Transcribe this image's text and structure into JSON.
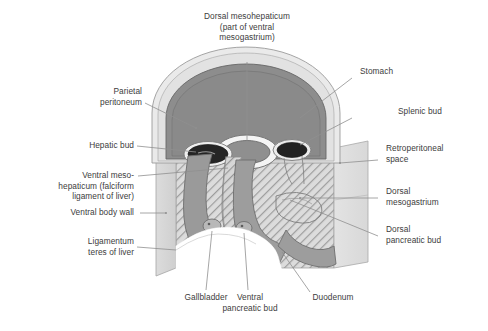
{
  "figure": {
    "colors": {
      "text": "#3c3c3c",
      "leader": "#8c8c8c",
      "stomach_fill": "#8d8d8d",
      "peritoneum_fill": "#e9e9e9",
      "bud_dark": "#2b2b2b",
      "mesogastrium_hatch": "#a9a9a9",
      "body_wall": "#d2d2d2",
      "outline": "#6f6f6f",
      "background": "#ffffff"
    }
  },
  "labels": {
    "top": [
      {
        "id": "dorsal-mesohepaticum",
        "text": "Dorsal mesohepaticum\n(part of ventral\nmesogastrium)",
        "align": "center"
      }
    ],
    "left": [
      {
        "id": "parietal-peritoneum",
        "text": "Parietal\nperitoneum"
      },
      {
        "id": "hepatic-bud",
        "text": "Hepatic bud"
      },
      {
        "id": "ventral-mesohepaticum",
        "text": "Ventral meso-\nhepaticum (falciform\nligament of liver)"
      },
      {
        "id": "ventral-body-wall",
        "text": "Ventral body wall"
      },
      {
        "id": "ligamentum-teres",
        "text": "Ligamentum\nteres of liver"
      }
    ],
    "right": [
      {
        "id": "stomach",
        "text": "Stomach"
      },
      {
        "id": "splenic-bud",
        "text": "Splenic bud"
      },
      {
        "id": "retroperitoneal-space",
        "text": "Retroperitoneal\nspace"
      },
      {
        "id": "dorsal-mesogastrium",
        "text": "Dorsal\nmesogastrium"
      },
      {
        "id": "dorsal-pancreatic-bud",
        "text": "Dorsal\npancreatic bud"
      }
    ],
    "bottom": [
      {
        "id": "gallbladder",
        "text": "Gallbladder"
      },
      {
        "id": "ventral-pancreatic-bud",
        "text": "Ventral\npancreatic bud"
      },
      {
        "id": "duodenum",
        "text": "Duodenum"
      }
    ]
  }
}
